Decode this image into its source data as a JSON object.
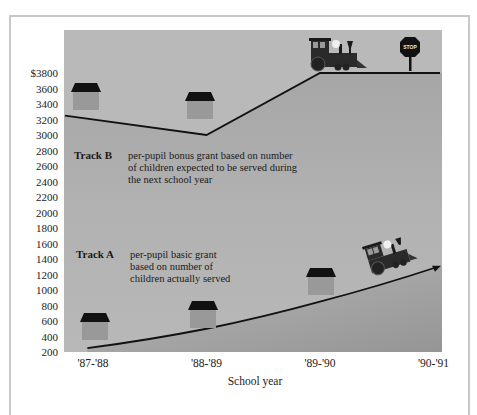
{
  "chart_data": {
    "type": "line",
    "title": "",
    "xlabel": "School year",
    "ylabel": "",
    "categories": [
      "'87-'88",
      "'88-'89",
      "'89-'90",
      "'90-'91"
    ],
    "y_ticks": [
      "200",
      "400",
      "600",
      "800",
      "1000",
      "1200",
      "1400",
      "1600",
      "1800",
      "2000",
      "2200",
      "2400",
      "2600",
      "2800",
      "3000",
      "3200",
      "3400",
      "3600",
      "$3800"
    ],
    "ylim": [
      200,
      3800
    ],
    "grid": false,
    "series": [
      {
        "name": "Track B",
        "description_lines": [
          "per-pupil  bonus grant based on number",
          "of children expected to be served during",
          "the next school year"
        ],
        "points": [
          {
            "x": -0.55,
            "y": 3250
          },
          {
            "x": 1.0,
            "y": 3000
          },
          {
            "x": 2.0,
            "y": 3800
          },
          {
            "x": 3.2,
            "y": 3800
          }
        ]
      },
      {
        "name": "Track A",
        "description_lines": [
          "per-pupil  basic grant",
          "based on number of",
          "children actually served"
        ],
        "points": [
          {
            "x": -0.05,
            "y": 250
          },
          {
            "x": 1.0,
            "y": 500
          },
          {
            "x": 2.0,
            "y": 850
          },
          {
            "x": 3.2,
            "y": 1300
          }
        ]
      }
    ],
    "annotations": {
      "stop_sign_text": "STOP",
      "icons": [
        "house-icon",
        "house-icon",
        "train-icon",
        "stop-sign-icon",
        "house-icon",
        "house-icon",
        "house-icon",
        "train-icon"
      ]
    }
  },
  "colors": {
    "plot_bg": "#b4b4b4",
    "ground": "#a0a0a0",
    "line": "#111111",
    "house_roof": "#111111",
    "house_body": "#999999"
  }
}
